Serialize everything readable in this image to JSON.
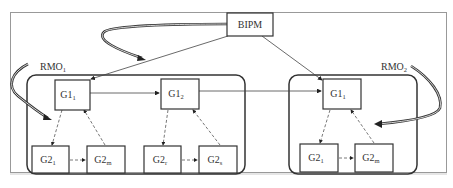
{
  "diagram": {
    "type": "hierarchy",
    "top_node": {
      "id": "bipm",
      "label": "BIPM"
    },
    "regions": [
      {
        "id": "rmo1",
        "label": "RMO",
        "label_sub": "1",
        "level1": [
          {
            "id": "g1_1_left",
            "label": "G1",
            "sub": "1"
          },
          {
            "id": "g1_2",
            "label": "G1",
            "sub": "2"
          }
        ],
        "level2": [
          {
            "id": "g2_1_left",
            "label": "G2",
            "sub": "1",
            "parent": "g1_1_left"
          },
          {
            "id": "g2_m_left",
            "label": "G2",
            "sub": "m",
            "parent": "g1_1_left"
          },
          {
            "id": "g2_r",
            "label": "G2",
            "sub": "r",
            "parent": "g1_2"
          },
          {
            "id": "g2_s",
            "label": "G2",
            "sub": "s",
            "parent": "g1_2"
          }
        ]
      },
      {
        "id": "rmo2",
        "label": "RMO",
        "label_sub": "2",
        "level1": [
          {
            "id": "g1_1_right",
            "label": "G1",
            "sub": "1"
          }
        ],
        "level2": [
          {
            "id": "g2_1_right",
            "label": "G2",
            "sub": "1",
            "parent": "g1_1_right"
          },
          {
            "id": "g2_m_right",
            "label": "G2",
            "sub": "m",
            "parent": "g1_1_right"
          }
        ]
      }
    ],
    "edges": [
      {
        "from": "bipm",
        "to": "g1_1_left",
        "style": "solid"
      },
      {
        "from": "bipm",
        "to": "g1_1_right",
        "style": "solid"
      },
      {
        "from": "g1_1_left",
        "to": "g1_2",
        "style": "solid"
      },
      {
        "from": "g1_2",
        "to": "g1_1_right",
        "style": "solid"
      },
      {
        "from": "g1_1_left",
        "to": "g2_1_left",
        "style": "dashed"
      },
      {
        "from": "g2_m_left",
        "to": "g1_1_left",
        "style": "dashed"
      },
      {
        "from": "g2_1_left",
        "to": "g2_m_left",
        "style": "dashed"
      },
      {
        "from": "g1_2",
        "to": "g2_r",
        "style": "dashed"
      },
      {
        "from": "g2_s",
        "to": "g1_2",
        "style": "dashed"
      },
      {
        "from": "g2_r",
        "to": "g2_s",
        "style": "dashed"
      },
      {
        "from": "g1_1_right",
        "to": "g2_1_right",
        "style": "dashed"
      },
      {
        "from": "g2_m_right",
        "to": "g1_1_right",
        "style": "dashed"
      },
      {
        "from": "g2_1_right",
        "to": "g2_m_right",
        "style": "dashed"
      }
    ],
    "colors": {
      "stroke": "#333333",
      "frame": "#999999",
      "background": "#ffffff"
    }
  },
  "labels": {
    "bipm": "BIPM",
    "rmo1": "RMO",
    "rmo1_sub": "1",
    "rmo2": "RMO",
    "rmo2_sub": "2",
    "g1": "G1",
    "g2": "G2",
    "sub_1": "1",
    "sub_2": "2",
    "sub_m": "m",
    "sub_r": "r",
    "sub_s": "s"
  }
}
